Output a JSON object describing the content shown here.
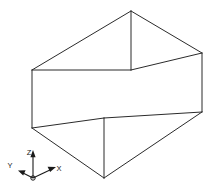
{
  "figure": {
    "background_color": "#ffffff",
    "line_color": "#2b2b2b",
    "axis_color": "#1a1a1a"
  },
  "box": {
    "name": "wireframe-cuboid",
    "projection": "isometric",
    "vertices": {
      "top_back": [
        131,
        11
      ],
      "top_left": [
        32,
        70
      ],
      "top_right": [
        202,
        53
      ],
      "top_front": [
        131,
        70
      ],
      "bottom_left": [
        32,
        128
      ],
      "bottom_right": [
        202,
        112
      ],
      "bottom_near": [
        104,
        118
      ],
      "bottom_front": [
        104,
        178
      ]
    },
    "edges": [
      {
        "name": "top-back-to-top-left",
        "path": "M 131 11 L 32 70"
      },
      {
        "name": "top-back-to-top-right",
        "path": "M 131 11 L 202 53"
      },
      {
        "name": "top-back-vertical",
        "path": "M 131 11 L 131 70"
      },
      {
        "name": "top-left-to-center",
        "path": "M 32 70 L 131 70"
      },
      {
        "name": "top-right-to-center",
        "path": "M 202 53 L 131 70"
      },
      {
        "name": "top-left-vertical",
        "path": "M 32 70 L 32 128"
      },
      {
        "name": "top-right-vertical",
        "path": "M 202 53 L 202 112"
      },
      {
        "name": "bottom-left-to-near",
        "path": "M 32 128 L 104 118"
      },
      {
        "name": "bottom-right-to-near",
        "path": "M 202 112 L 104 118"
      },
      {
        "name": "bottom-left-to-front",
        "path": "M 32 128 L 104 178"
      },
      {
        "name": "bottom-right-to-front",
        "path": "M 202 112 L 104 178"
      },
      {
        "name": "front-vertical",
        "path": "M 104 118 L 104 178"
      }
    ]
  },
  "axes": {
    "name": "coordinate-triad",
    "origin": [
      33,
      178
    ],
    "items": [
      {
        "id": "z",
        "label": "Z",
        "label_pos": [
          29,
          155
        ],
        "line": "M 33 178 L 33 153",
        "arrow": "M 33 150 L 30.4 157.2 L 35.6 157.2 Z"
      },
      {
        "id": "x",
        "label": "X",
        "label_pos": [
          59,
          171
        ],
        "line": "M 33 178 L 52 169",
        "arrow": "M 56 167 L 47.6 166.7 L 50.1 171.9 Z"
      },
      {
        "id": "y",
        "label": "Y",
        "label_pos": [
          10,
          168
        ],
        "line": "M 33 178 L 23 173",
        "arrow": "M 18 170.5 L 25.6 170.3 L 23.2 175.5 Z"
      }
    ]
  }
}
